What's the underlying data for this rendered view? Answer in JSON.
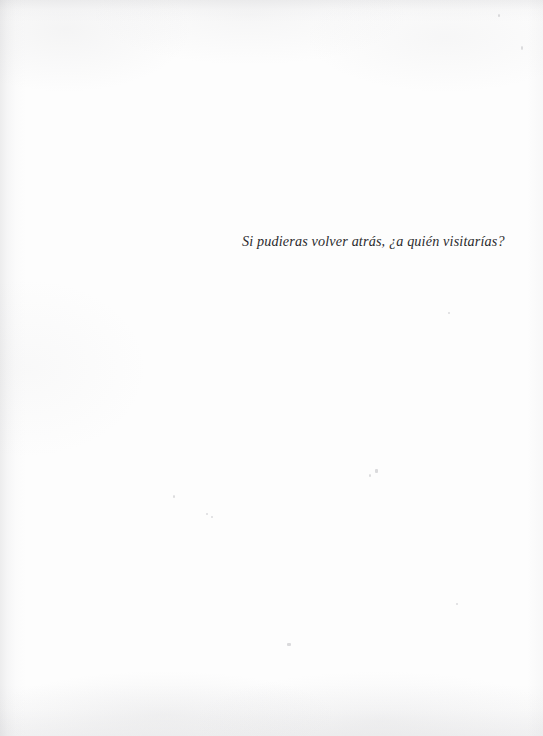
{
  "page": {
    "kind": "scanned-book-page",
    "background_color": "#fdfdfd",
    "text_color": "#2b2b2d",
    "width": 543,
    "height": 736
  },
  "content": {
    "epigraph": "Si pudieras volver atrás, ¿a quién visitarías?"
  },
  "artifacts": {
    "specks": [
      {
        "name": "speck-upper-right",
        "x": 498,
        "y": 14,
        "w": 2,
        "h": 3
      },
      {
        "name": "speck-right-margin",
        "x": 521,
        "y": 46,
        "w": 2,
        "h": 4
      },
      {
        "name": "speck-mid-right",
        "x": 448,
        "y": 312,
        "w": 2,
        "h": 2
      },
      {
        "name": "speck-left-margin",
        "x": 173,
        "y": 495,
        "w": 2,
        "h": 3
      },
      {
        "name": "speck-center-left",
        "x": 206,
        "y": 513,
        "w": 2,
        "h": 2
      },
      {
        "name": "speck-center",
        "x": 375,
        "y": 469,
        "w": 3,
        "h": 4
      },
      {
        "name": "speck-center-low",
        "x": 369,
        "y": 474,
        "w": 2,
        "h": 3
      },
      {
        "name": "speck-lower-center",
        "x": 287,
        "y": 643,
        "w": 4,
        "h": 3
      },
      {
        "name": "speck-lower-left",
        "x": 211,
        "y": 516,
        "w": 2,
        "h": 2
      },
      {
        "name": "speck-lower-right",
        "x": 456,
        "y": 603,
        "w": 2,
        "h": 2
      }
    ]
  }
}
